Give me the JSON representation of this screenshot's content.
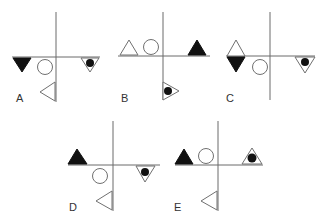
{
  "figure": {
    "type": "visual-reasoning-options",
    "options": [
      {
        "label": "A",
        "shapes": [
          "solid-down-triangle-left",
          "circle-below-left",
          "down-triangle-with-dot-right",
          "left-pointing-triangle-below"
        ]
      },
      {
        "label": "B",
        "shapes": [
          "outline-up-triangle-left",
          "circle-above-left",
          "solid-up-triangle-right",
          "right-pointing-triangle-with-dot-below"
        ]
      },
      {
        "label": "C",
        "shapes": [
          "diamond-outline-top-solid-bottom-left",
          "circle-below-left",
          "down-triangle-with-dot-right"
        ]
      },
      {
        "label": "D",
        "shapes": [
          "solid-up-triangle-left",
          "circle-below-left",
          "down-triangle-with-dot-right",
          "left-pointing-triangle-below"
        ]
      },
      {
        "label": "E",
        "shapes": [
          "solid-up-triangle-left",
          "circle-above-left",
          "up-triangle-with-dot-right",
          "left-pointing-triangle-below"
        ]
      }
    ]
  }
}
